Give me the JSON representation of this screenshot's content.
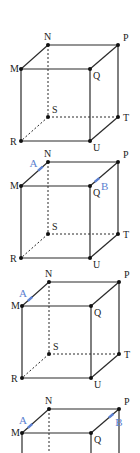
{
  "colors": {
    "edge": "#2a2a2a",
    "vertex": "#111111",
    "highlight": "#5b7fd0"
  },
  "vertex_labels": [
    "M",
    "N",
    "P",
    "Q",
    "R",
    "S",
    "T",
    "U"
  ],
  "figures": [
    {
      "id": "figure-1",
      "points": []
    },
    {
      "id": "figure-2",
      "points": [
        {
          "label": "A",
          "edge": "MN",
          "t": 0.72
        },
        {
          "label": "B",
          "edge": "QP",
          "t": 0.25
        }
      ]
    },
    {
      "id": "figure-3",
      "points": [
        {
          "label": "A",
          "edge": "MN",
          "t": 0.3
        }
      ]
    },
    {
      "id": "figure-4",
      "points": [
        {
          "label": "A",
          "edge": "MN",
          "t": 0.3
        },
        {
          "label": "B",
          "edge": "QP",
          "t": 0.72
        }
      ]
    }
  ]
}
